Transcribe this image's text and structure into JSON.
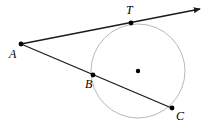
{
  "figure": {
    "kind": "geometry-diagram",
    "width": 211,
    "height": 128,
    "background_color": "#ffffff",
    "line_color": "#1a1a1a",
    "circle_color": "#b9b9b9",
    "dot_color": "#000000"
  },
  "circle": {
    "center_x": 138,
    "center_y": 71,
    "radius": 47,
    "stroke_width": 1
  },
  "center_dot": {
    "x": 138,
    "y": 71,
    "r": 2.2
  },
  "points": [
    {
      "id": "A",
      "label": "A",
      "x": 21,
      "y": 44,
      "label_x": 9,
      "label_y": 48,
      "dot_r": 2.4
    },
    {
      "id": "T",
      "label": "T",
      "x": 131,
      "y": 23,
      "label_x": 126,
      "label_y": 4,
      "dot_r": 2.4
    },
    {
      "id": "B",
      "label": "B",
      "x": 93,
      "y": 75,
      "label_x": 85,
      "label_y": 78,
      "dot_r": 2.4
    },
    {
      "id": "C",
      "label": "C",
      "x": 172,
      "y": 108,
      "label_x": 176,
      "label_y": 110,
      "dot_r": 2.4
    }
  ],
  "segments": [
    {
      "id": "tangent-ray-AT",
      "from": "A",
      "to": "arrow-tip",
      "x1": 21,
      "y1": 44,
      "x2": 200,
      "y2": 9,
      "has_arrow": true
    },
    {
      "id": "secant-ABC",
      "from": "A",
      "to": "C",
      "x1": 21,
      "y1": 44,
      "x2": 174,
      "y2": 109,
      "has_arrow": false
    }
  ],
  "arrow": {
    "tip_x": 200,
    "tip_y": 9,
    "size": 7
  },
  "labels": {
    "A": "A",
    "T": "T",
    "B": "B",
    "C": "C"
  }
}
